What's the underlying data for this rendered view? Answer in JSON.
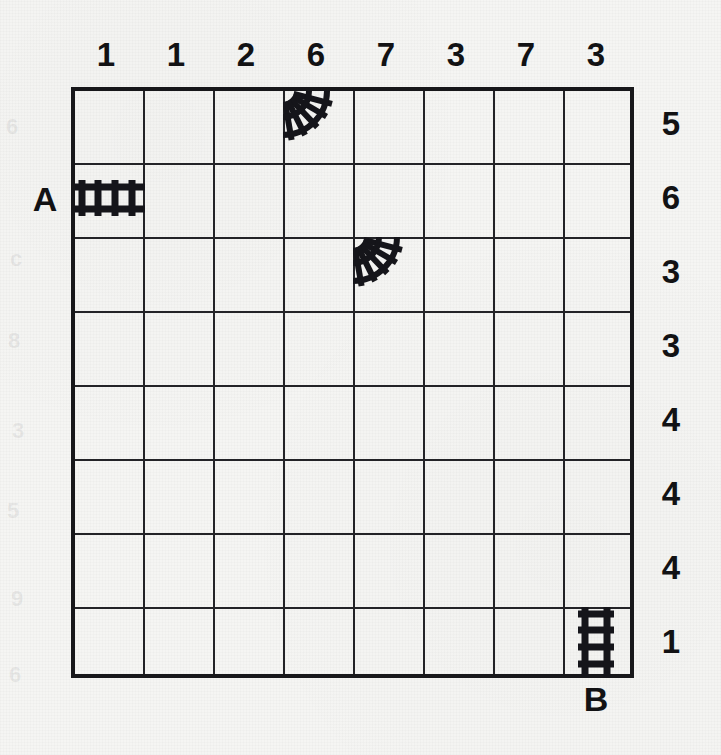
{
  "puzzle": {
    "type": "train-tracks-grid",
    "rows": 8,
    "cols": 8,
    "ink_color": "#121214",
    "grid_line_color": "#232327",
    "background_color": "#f4f4f2"
  },
  "column_clues": [
    "1",
    "1",
    "2",
    "6",
    "7",
    "3",
    "7",
    "3"
  ],
  "row_clues": [
    "5",
    "6",
    "3",
    "3",
    "4",
    "4",
    "4",
    "1"
  ],
  "endpoints": [
    {
      "label": "A",
      "side": "left",
      "row": 2
    },
    {
      "label": "B",
      "side": "bottom",
      "col": 8
    }
  ],
  "track_pieces": [
    {
      "name": "straight-horizontal-track",
      "shape": "straight-horizontal",
      "row": 2,
      "col": 1
    },
    {
      "name": "curve-track-top-right",
      "shape": "curve",
      "row": 1,
      "col": 4
    },
    {
      "name": "curve-track-top-right",
      "shape": "curve",
      "row": 3,
      "col": 5
    },
    {
      "name": "straight-vertical-track",
      "shape": "straight-vertical",
      "row": 8,
      "col": 8
    }
  ],
  "ghost_marks": [
    {
      "text": "6",
      "x": 6,
      "y": 116
    },
    {
      "text": "c",
      "x": 10,
      "y": 248
    },
    {
      "text": "8",
      "x": 8,
      "y": 330
    },
    {
      "text": "3",
      "x": 12,
      "y": 420
    },
    {
      "text": "5",
      "x": 7,
      "y": 500
    },
    {
      "text": "9",
      "x": 11,
      "y": 588
    },
    {
      "text": "6",
      "x": 9,
      "y": 664
    }
  ]
}
